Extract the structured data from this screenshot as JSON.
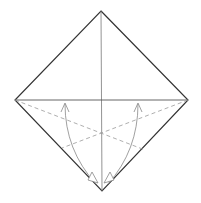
{
  "diagram": {
    "type": "origami-fold-diagram",
    "colors": {
      "outline": "#333333",
      "crease": "#777777",
      "dashed": "#999999",
      "arrow": "#888888",
      "background": "#ffffff"
    }
  }
}
